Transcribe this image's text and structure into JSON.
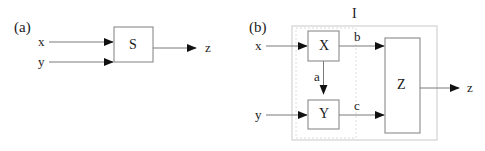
{
  "figure": {
    "type": "block-diagram",
    "background": "#ffffff",
    "stroke_color": "#7a7a7a",
    "arrow_color": "#111111",
    "text_color": "#1b1b1b",
    "panels": [
      {
        "id": "a",
        "label": "(a)",
        "inputs": [
          {
            "name": "x",
            "label": "x"
          },
          {
            "name": "y",
            "label": "y"
          }
        ],
        "blocks": [
          {
            "name": "S",
            "label": "S"
          }
        ],
        "outputs": [
          {
            "name": "z",
            "label": "z"
          }
        ]
      },
      {
        "id": "b",
        "label": "(b)",
        "container_label": "I",
        "inputs": [
          {
            "name": "x",
            "label": "x"
          },
          {
            "name": "y",
            "label": "y"
          }
        ],
        "blocks": [
          {
            "name": "X",
            "label": "X"
          },
          {
            "name": "Y",
            "label": "Y"
          },
          {
            "name": "Z",
            "label": "Z"
          }
        ],
        "internal_signals": [
          {
            "name": "a",
            "label": "a",
            "from": "X",
            "to": "Y"
          },
          {
            "name": "b",
            "label": "b",
            "from": "X",
            "to": "Z"
          },
          {
            "name": "c",
            "label": "c",
            "from": "Y",
            "to": "Z"
          }
        ],
        "outputs": [
          {
            "name": "z",
            "label": "z"
          }
        ]
      }
    ]
  }
}
